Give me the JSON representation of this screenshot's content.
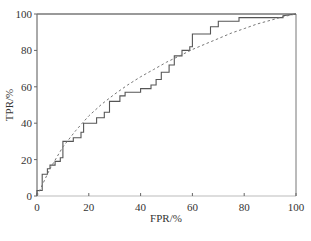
{
  "chart_data": {
    "type": "line",
    "title": "",
    "xlabel": "FPR/%",
    "ylabel": "TPR/%",
    "xlim": [
      0,
      100
    ],
    "ylim": [
      0,
      100
    ],
    "xticks": [
      0,
      20,
      40,
      60,
      80,
      100
    ],
    "yticks": [
      0,
      20,
      40,
      60,
      80,
      100
    ],
    "grid": false,
    "legend": null,
    "series": [
      {
        "name": "empirical ROC",
        "style": "solid-step",
        "color": "#555555",
        "points": [
          [
            0,
            0
          ],
          [
            0,
            3
          ],
          [
            2,
            3
          ],
          [
            2,
            12
          ],
          [
            4,
            12
          ],
          [
            4,
            15
          ],
          [
            5,
            15
          ],
          [
            5,
            17
          ],
          [
            7,
            17
          ],
          [
            7,
            19
          ],
          [
            9,
            19
          ],
          [
            9,
            21
          ],
          [
            10,
            21
          ],
          [
            10,
            30
          ],
          [
            14,
            30
          ],
          [
            14,
            32
          ],
          [
            17,
            32
          ],
          [
            17,
            35
          ],
          [
            18,
            35
          ],
          [
            18,
            40
          ],
          [
            23,
            40
          ],
          [
            23,
            43
          ],
          [
            26,
            43
          ],
          [
            26,
            46
          ],
          [
            28,
            46
          ],
          [
            28,
            52
          ],
          [
            32,
            52
          ],
          [
            32,
            55
          ],
          [
            34,
            55
          ],
          [
            34,
            57
          ],
          [
            40,
            57
          ],
          [
            40,
            59
          ],
          [
            44,
            59
          ],
          [
            44,
            61
          ],
          [
            46,
            61
          ],
          [
            46,
            64
          ],
          [
            48,
            64
          ],
          [
            48,
            68
          ],
          [
            51,
            68
          ],
          [
            51,
            72
          ],
          [
            53,
            72
          ],
          [
            53,
            77
          ],
          [
            56,
            77
          ],
          [
            56,
            80
          ],
          [
            59,
            80
          ],
          [
            59,
            82
          ],
          [
            60,
            82
          ],
          [
            60,
            89
          ],
          [
            67,
            89
          ],
          [
            67,
            93
          ],
          [
            70,
            93
          ],
          [
            70,
            96
          ],
          [
            78,
            96
          ],
          [
            78,
            98
          ],
          [
            95,
            98
          ],
          [
            95,
            99
          ],
          [
            100,
            100
          ]
        ]
      },
      {
        "name": "fitted ROC",
        "style": "dashed",
        "color": "#777777",
        "points": [
          [
            0,
            0
          ],
          [
            2,
            6
          ],
          [
            5,
            15
          ],
          [
            10,
            27
          ],
          [
            15,
            36
          ],
          [
            20,
            44
          ],
          [
            25,
            50.5
          ],
          [
            30,
            56
          ],
          [
            35,
            61
          ],
          [
            40,
            65.5
          ],
          [
            45,
            69.5
          ],
          [
            50,
            73.5
          ],
          [
            55,
            77
          ],
          [
            60,
            80.5
          ],
          [
            65,
            83.5
          ],
          [
            70,
            86.5
          ],
          [
            75,
            89.5
          ],
          [
            80,
            92
          ],
          [
            85,
            94.5
          ],
          [
            90,
            96.5
          ],
          [
            95,
            98.5
          ],
          [
            100,
            100
          ]
        ]
      }
    ]
  },
  "axes": {
    "x_title": "FPR/%",
    "y_title": "TPR/%",
    "x_tick_labels": [
      "0",
      "20",
      "40",
      "60",
      "80",
      "100"
    ],
    "y_tick_labels": [
      "0",
      "20",
      "40",
      "60",
      "80",
      "100"
    ]
  }
}
